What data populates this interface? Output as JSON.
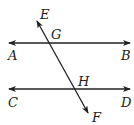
{
  "diagram": {
    "type": "parallel-lines-with-transversal",
    "colors": {
      "line": "#222222",
      "label": "#222222",
      "background": "#ffffff"
    },
    "lines": [
      {
        "id": "AB",
        "from": [
          9,
          43
        ],
        "to": [
          130,
          43
        ],
        "arrows": "both"
      },
      {
        "id": "CD",
        "from": [
          9,
          89
        ],
        "to": [
          130,
          89
        ],
        "arrows": "both"
      },
      {
        "id": "EF",
        "from": [
          37,
          21
        ],
        "to": [
          88,
          113
        ],
        "arrows": "both"
      }
    ],
    "labels": {
      "E": "E",
      "G": "G",
      "A": "A",
      "B": "B",
      "H": "H",
      "C": "C",
      "D": "D",
      "F": "F"
    },
    "intersections": [
      {
        "point": "G",
        "lines": [
          "AB",
          "EF"
        ]
      },
      {
        "point": "H",
        "lines": [
          "CD",
          "EF"
        ]
      }
    ]
  }
}
